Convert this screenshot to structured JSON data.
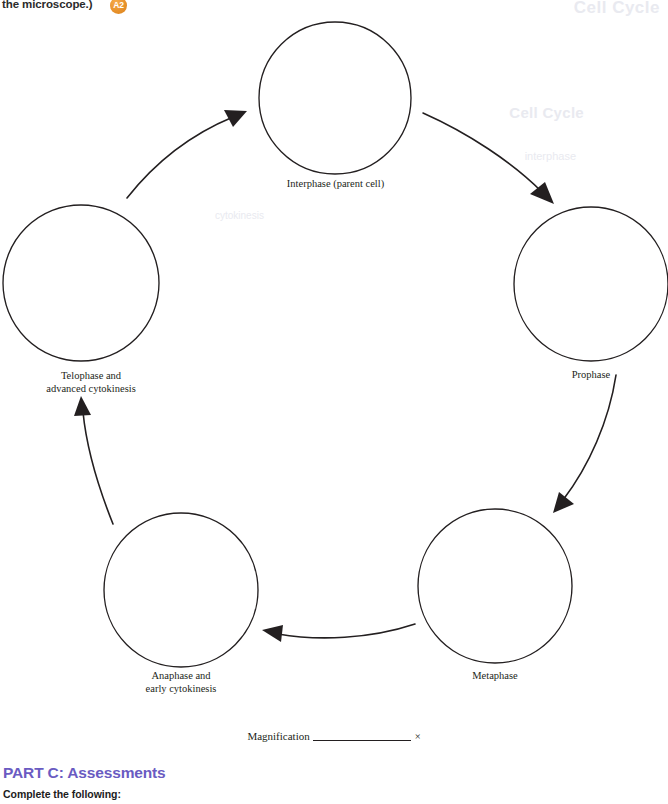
{
  "page": {
    "header_tail_text": "the microscope.)",
    "figure_badge_label": "A2",
    "badge_color": "#e8922c"
  },
  "bleed_through": {
    "title": "Cell Cycle",
    "subtitle": "Cell Cycle",
    "line1": "interphase",
    "line2": "cytokinesis"
  },
  "diagram": {
    "name": "cell-cycle-diagram",
    "stages": [
      {
        "id": "interphase",
        "label": "Interphase (parent cell)",
        "cx": 335,
        "cy": 98,
        "r": 76
      },
      {
        "id": "prophase",
        "label": "Prophase",
        "cx": 591,
        "cy": 284,
        "r": 77
      },
      {
        "id": "metaphase",
        "label": "Metaphase",
        "cx": 495,
        "cy": 586,
        "r": 77
      },
      {
        "id": "anaphase",
        "label": "Anaphase and\nearly cytokinesis",
        "cx": 181,
        "cy": 590,
        "r": 77
      },
      {
        "id": "telophase",
        "label": "Telophase and\nadvanced cytokinesis",
        "cx": 81,
        "cy": 283,
        "r": 78
      }
    ],
    "labels": {
      "interphase": "Interphase (parent cell)",
      "prophase": "Prophase",
      "metaphase": "Metaphase",
      "anaphase_line1": "Anaphase and",
      "anaphase_line2": "early cytokinesis",
      "telophase_line1": "Telophase and",
      "telophase_line2": "advanced cytokinesis"
    },
    "stroke_color": "#231f20"
  },
  "magnification": {
    "label": "Magnification",
    "value": "",
    "unit": "×"
  },
  "part_c": {
    "heading": "PART C:  Assessments",
    "subheading": "Complete the following:",
    "accent_color": "#6a5bc2"
  }
}
